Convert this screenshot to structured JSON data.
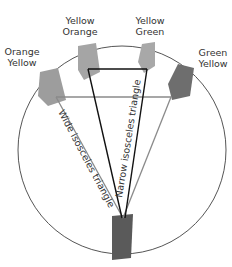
{
  "diagram": {
    "title": "",
    "labels": {
      "orange_yellow": [
        "Orange",
        "Yellow"
      ],
      "yellow_orange": [
        "Yellow",
        "Orange"
      ],
      "yellow_green": [
        "Yellow",
        "Green"
      ],
      "green_yellow": [
        "Green",
        "Yellow"
      ]
    },
    "triangles": {
      "wide": "Wide isosceles triangle",
      "narrow": "Narrow isosceles triangle"
    },
    "colors": {
      "circle": "#555555",
      "narrow_line": "#111111",
      "wide_line": "#8a8a8a",
      "swatch_orange_yellow": "#9d9d9d",
      "swatch_yellow_orange": "#a5a5a5",
      "swatch_yellow_green": "#a8a8a8",
      "swatch_green_yellow": "#6e6e6e",
      "swatch_bottom": "#5a5a5a"
    }
  }
}
